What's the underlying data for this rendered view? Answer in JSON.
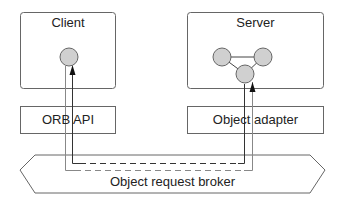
{
  "diagram": {
    "client": {
      "title": "Client"
    },
    "server": {
      "title": "Server"
    },
    "orb_api": {
      "label": "ORB API"
    },
    "object_adapter": {
      "label": "Object adapter"
    },
    "broker": {
      "label": "Object request broker"
    }
  },
  "colors": {
    "stroke": "#555555",
    "node_fill": "#d0d0d0",
    "arrow": "#111111"
  }
}
